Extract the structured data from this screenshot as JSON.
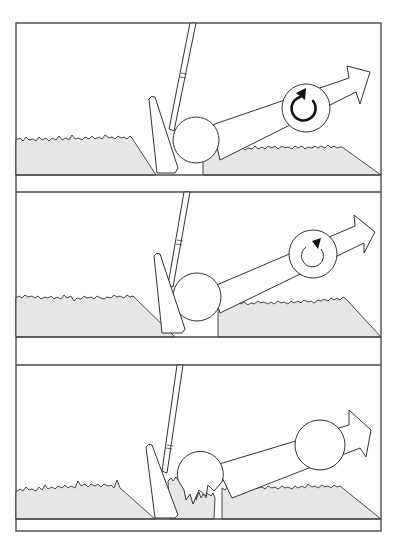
{
  "figure": {
    "title": "",
    "colors": {
      "background": "#ffffff",
      "outline": "#333333",
      "grass_fill": "#e6e6e6",
      "frame": "#4a4a4a",
      "spin_arrow": "#111111"
    },
    "panels": [
      {
        "id": "panel-1",
        "lie": "ball sitting down in grass, clean contact",
        "ball": {
          "cx": 196,
          "cy": 140,
          "r": 23
        },
        "spin_indicator": {
          "cx": 306,
          "cy": 108,
          "r": 24,
          "strength": "heavy",
          "direction": "backspin"
        },
        "flight_arrow": true
      },
      {
        "id": "panel-2",
        "lie": "ball sitting up on grass",
        "ball": {
          "cx": 197,
          "cy": 297,
          "r": 24
        },
        "spin_indicator": {
          "cx": 313,
          "cy": 254,
          "r": 24,
          "strength": "light",
          "direction": "backspin"
        },
        "flight_arrow": true
      },
      {
        "id": "panel-3",
        "lie": "grass trapped between clubface and ball (flyer lie)",
        "ball": {
          "cx": 200,
          "cy": 470,
          "r": 23
        },
        "second_ball": {
          "cx": 320,
          "cy": 445,
          "r": 25
        },
        "spin_indicator": null,
        "flight_arrow": true
      }
    ]
  }
}
